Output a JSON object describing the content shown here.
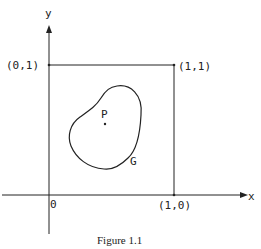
{
  "figure": {
    "caption": "Figure 1.1",
    "axes": {
      "x_label": "x",
      "y_label": "y",
      "origin_label": "0"
    },
    "points": {
      "p01": "(0,1)",
      "p11": "(1,1)",
      "p10": "(1,0)",
      "P": "P"
    },
    "region_label": "G",
    "stroke_color": "#222222"
  }
}
